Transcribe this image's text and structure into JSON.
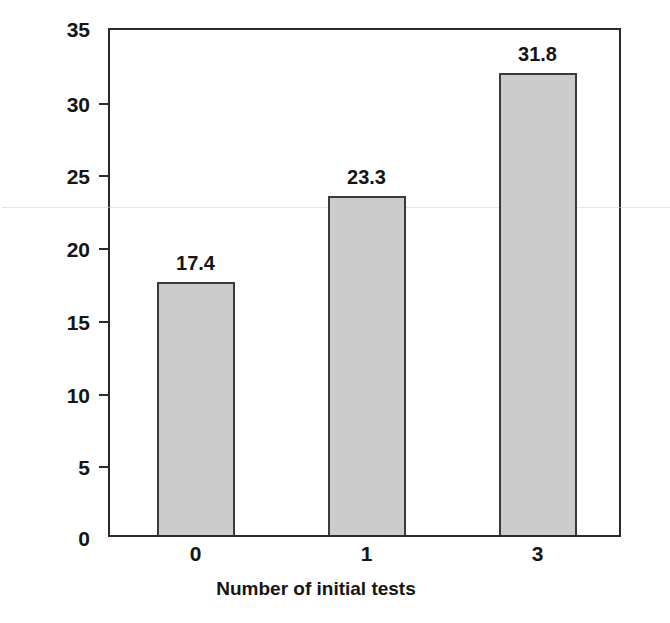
{
  "chart_data": {
    "type": "bar",
    "title": "",
    "xlabel": "Number of initial tests",
    "ylabel": "Number of pictures recalled",
    "categories": [
      "0",
      "1",
      "3"
    ],
    "values": [
      17.4,
      23.3,
      31.8
    ],
    "value_labels": [
      "17.4",
      "23.3",
      "31.8"
    ],
    "ylim": [
      0,
      35
    ],
    "yticks": [
      "0",
      "5",
      "10",
      "15",
      "20",
      "25",
      "30",
      "35"
    ],
    "ytick_values": [
      0,
      5,
      10,
      15,
      20,
      25,
      30,
      35
    ],
    "grid": false,
    "legend": false,
    "legend_position": "none",
    "bar_color": "#cccccc",
    "bar_edge_color": "#3a3a3a",
    "axis_color": "#2b2b2b",
    "background": "#ffffff"
  }
}
